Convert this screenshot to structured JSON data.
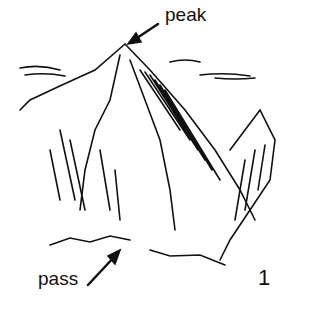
{
  "figure": {
    "type": "line-drawing illustration of a mountain",
    "labels": {
      "peak": "peak",
      "pass": "pass",
      "figure_number": "1"
    }
  }
}
